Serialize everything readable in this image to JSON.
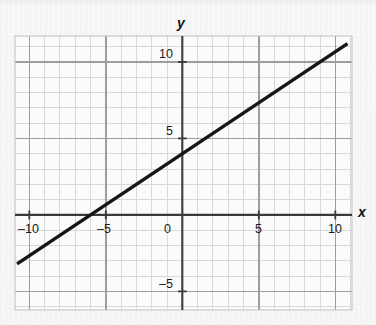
{
  "figure": {
    "kind": "cartesian-line-graph",
    "background_color": "#f7f7f7",
    "axis_color": "#3d3d3d",
    "grid_major_color": "#9e9e9e",
    "grid_minor_color": "#d8d8d8",
    "line_color": "#161616"
  },
  "axes": {
    "x_axis_label": "x",
    "y_axis_label": "y",
    "x_ticks": [
      {
        "label": "–10",
        "value": -10
      },
      {
        "label": "–5",
        "value": -5
      },
      {
        "label": "0",
        "value": 0
      },
      {
        "label": "5",
        "value": 5
      },
      {
        "label": "10",
        "value": 10
      }
    ],
    "y_ticks": [
      {
        "label": "10",
        "value": 10
      },
      {
        "label": "5",
        "value": 5
      },
      {
        "label": "–5",
        "value": -5
      }
    ]
  },
  "chart_data": {
    "type": "line",
    "title": "",
    "xlabel": "x",
    "ylabel": "y",
    "xlim": [
      -11,
      11
    ],
    "ylim": [
      -6.5,
      11.7
    ],
    "grid": true,
    "grid_minor_step": 1,
    "grid_major_step": 5,
    "legend": "none",
    "xticks": [
      -10,
      -5,
      0,
      5,
      10
    ],
    "yticks": [
      10,
      5,
      -5
    ],
    "series": [
      {
        "name": "line",
        "equation": "y = (2/3)x + 4",
        "slope": 0.6667,
        "intercept": 4,
        "x_intercept": -6,
        "y_intercept": 4,
        "x": [
          -10.8,
          10.8
        ],
        "y": [
          -3.2,
          11.2
        ],
        "points": [
          {
            "x": -6,
            "y": 0
          },
          {
            "x": -3,
            "y": 2
          },
          {
            "x": 0,
            "y": 4
          },
          {
            "x": 3,
            "y": 6
          },
          {
            "x": 6,
            "y": 8
          },
          {
            "x": 9,
            "y": 10
          }
        ]
      }
    ]
  }
}
